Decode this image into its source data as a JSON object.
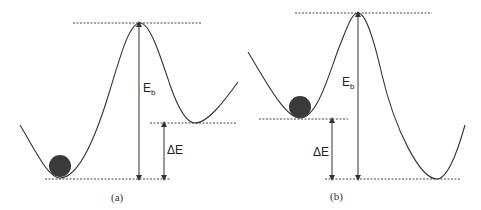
{
  "panels": [
    {
      "id": "a",
      "caption": "(a)",
      "barrier_label": "E",
      "barrier_sub": "b",
      "delta_label": "ΔE",
      "description": "Ball in lower (global) minimum; higher metastable minimum on the right"
    },
    {
      "id": "b",
      "caption": "(b)",
      "barrier_label": "E",
      "barrier_sub": "b",
      "delta_label": "ΔE",
      "description": "Ball in higher (metastable) minimum on the left; lower minimum on the right"
    }
  ],
  "colors": {
    "curve": "#333333",
    "ball": "#3a3a3a",
    "dotted": "#444444"
  }
}
